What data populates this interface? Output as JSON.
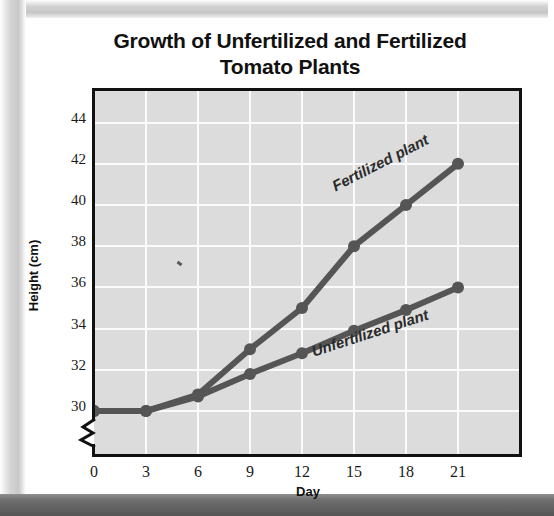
{
  "chart_data": {
    "type": "line",
    "title": "Growth of Unfertilized and Fertilized Tomato Plants",
    "title_line1": "Growth of Unfertilized and Fertilized",
    "title_line2": "Tomato Plants",
    "xlabel": "Day",
    "ylabel": "Height (cm)",
    "x": [
      0,
      3,
      6,
      9,
      12,
      15,
      18,
      21
    ],
    "xticklabels": [
      "0",
      "3",
      "6",
      "9",
      "12",
      "15",
      "18",
      "21"
    ],
    "yticklabels": [
      "30",
      "32",
      "34",
      "36",
      "38",
      "40",
      "42",
      "44"
    ],
    "yticks": [
      30,
      32,
      34,
      36,
      38,
      40,
      42,
      44
    ],
    "ylim": [
      29.2,
      44.7
    ],
    "xlim": [
      -0.6,
      22.6
    ],
    "y_axis_break": true,
    "grid": true,
    "legend_position": "inline-labels",
    "plot_background": "#dcdcdc",
    "gridline_color": "#fbfbfb",
    "line_color": "#555555",
    "series": [
      {
        "name": "Fertilized plant",
        "label": "Fertilized plant",
        "values": [
          30,
          30,
          30.8,
          33,
          35,
          38,
          40,
          42
        ]
      },
      {
        "name": "Unfertilized plant",
        "label": "Unfertilized plant",
        "values": [
          30,
          30,
          30.7,
          31.8,
          32.8,
          33.9,
          34.9,
          36
        ]
      }
    ]
  },
  "icons": {
    "axis_break": "axis-break-zigzag"
  }
}
